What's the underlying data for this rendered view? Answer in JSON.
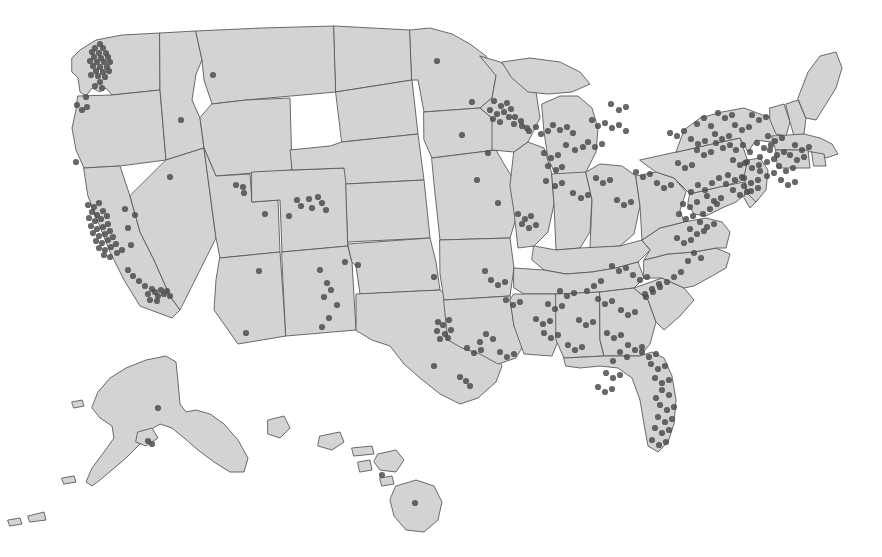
{
  "figure": {
    "width": 882,
    "height": 557,
    "background_color": "#ffffff"
  },
  "style": {
    "land_fill": "#d3d3d3",
    "land_stroke": "#5a5a5a",
    "land_stroke_width": 0.9,
    "point_color": "#4d4d4d",
    "point_opacity": 0.85,
    "point_radius": 3.1
  },
  "chart_data": {
    "type": "scatter",
    "xlabel": "",
    "ylabel": "",
    "projection": "albers-usa",
    "grid": false,
    "legend": null,
    "xlim": [
      0,
      882
    ],
    "ylim": [
      0,
      557
    ],
    "marker": {
      "shape": "circle",
      "radius": 3.1,
      "color": "#4d4d4d",
      "opacity": 0.85
    },
    "regions": [
      {
        "name": "Seattle-Puget Sound",
        "count": 26
      },
      {
        "name": "Portland-Oregon",
        "count": 4
      },
      {
        "name": "San Francisco Bay Area",
        "count": 30
      },
      {
        "name": "Los Angeles-San Diego",
        "count": 18
      },
      {
        "name": "Mountain West",
        "count": 14
      },
      {
        "name": "Colorado Front Range",
        "count": 9
      },
      {
        "name": "Southwest",
        "count": 12
      },
      {
        "name": "Texas Triangle",
        "count": 14
      },
      {
        "name": "Great Plains",
        "count": 10
      },
      {
        "name": "Upper Midwest",
        "count": 18
      },
      {
        "name": "Great Lakes",
        "count": 24
      },
      {
        "name": "Ohio Valley",
        "count": 14
      },
      {
        "name": "Southeast",
        "count": 20
      },
      {
        "name": "Florida",
        "count": 20
      },
      {
        "name": "Mid-Atlantic",
        "count": 16
      },
      {
        "name": "Northeast Corridor",
        "count": 58
      },
      {
        "name": "New England",
        "count": 16
      },
      {
        "name": "Alaska",
        "count": 3
      },
      {
        "name": "Hawaii",
        "count": 2
      }
    ],
    "total_points": 328,
    "points": [
      [
        100,
        44
      ],
      [
        95,
        48
      ],
      [
        103,
        48
      ],
      [
        92,
        52
      ],
      [
        99,
        53
      ],
      [
        106,
        53
      ],
      [
        94,
        57
      ],
      [
        101,
        58
      ],
      [
        108,
        57
      ],
      [
        90,
        61
      ],
      [
        97,
        62
      ],
      [
        104,
        62
      ],
      [
        110,
        62
      ],
      [
        93,
        66
      ],
      [
        100,
        67
      ],
      [
        107,
        67
      ],
      [
        96,
        71
      ],
      [
        103,
        72
      ],
      [
        109,
        71
      ],
      [
        91,
        75
      ],
      [
        98,
        76
      ],
      [
        105,
        77
      ],
      [
        100,
        82
      ],
      [
        95,
        86
      ],
      [
        102,
        88
      ],
      [
        86,
        97
      ],
      [
        77,
        105
      ],
      [
        87,
        107
      ],
      [
        82,
        110
      ],
      [
        76,
        162
      ],
      [
        88,
        205
      ],
      [
        94,
        207
      ],
      [
        99,
        203
      ],
      [
        92,
        212
      ],
      [
        97,
        215
      ],
      [
        103,
        211
      ],
      [
        89,
        218
      ],
      [
        95,
        221
      ],
      [
        101,
        219
      ],
      [
        107,
        216
      ],
      [
        91,
        226
      ],
      [
        97,
        229
      ],
      [
        103,
        227
      ],
      [
        108,
        224
      ],
      [
        93,
        233
      ],
      [
        99,
        236
      ],
      [
        105,
        234
      ],
      [
        110,
        231
      ],
      [
        96,
        241
      ],
      [
        102,
        243
      ],
      [
        108,
        240
      ],
      [
        113,
        237
      ],
      [
        99,
        248
      ],
      [
        105,
        250
      ],
      [
        111,
        247
      ],
      [
        116,
        244
      ],
      [
        104,
        255
      ],
      [
        110,
        257
      ],
      [
        117,
        253
      ],
      [
        122,
        250
      ],
      [
        125,
        209
      ],
      [
        128,
        228
      ],
      [
        131,
        245
      ],
      [
        128,
        270
      ],
      [
        133,
        276
      ],
      [
        139,
        281
      ],
      [
        145,
        286
      ],
      [
        152,
        289
      ],
      [
        148,
        294
      ],
      [
        155,
        292
      ],
      [
        161,
        290
      ],
      [
        158,
        296
      ],
      [
        164,
        294
      ],
      [
        167,
        291
      ],
      [
        170,
        296
      ],
      [
        150,
        300
      ],
      [
        157,
        301
      ],
      [
        213,
        75
      ],
      [
        181,
        120
      ],
      [
        135,
        215
      ],
      [
        170,
        177
      ],
      [
        236,
        185
      ],
      [
        243,
        187
      ],
      [
        244,
        193
      ],
      [
        297,
        200
      ],
      [
        301,
        206
      ],
      [
        309,
        199
      ],
      [
        318,
        197
      ],
      [
        322,
        203
      ],
      [
        312,
        208
      ],
      [
        326,
        210
      ],
      [
        289,
        216
      ],
      [
        265,
        214
      ],
      [
        259,
        271
      ],
      [
        246,
        333
      ],
      [
        320,
        270
      ],
      [
        327,
        283
      ],
      [
        331,
        290
      ],
      [
        324,
        297
      ],
      [
        337,
        305
      ],
      [
        329,
        318
      ],
      [
        322,
        327
      ],
      [
        345,
        262
      ],
      [
        358,
        265
      ],
      [
        434,
        277
      ],
      [
        438,
        322
      ],
      [
        443,
        325
      ],
      [
        449,
        320
      ],
      [
        437,
        331
      ],
      [
        445,
        334
      ],
      [
        440,
        339
      ],
      [
        451,
        330
      ],
      [
        448,
        338
      ],
      [
        434,
        366
      ],
      [
        460,
        377
      ],
      [
        466,
        381
      ],
      [
        470,
        386
      ],
      [
        437,
        61
      ],
      [
        472,
        102
      ],
      [
        462,
        135
      ],
      [
        477,
        180
      ],
      [
        488,
        153
      ],
      [
        498,
        203
      ],
      [
        485,
        271
      ],
      [
        494,
        101
      ],
      [
        501,
        106
      ],
      [
        507,
        103
      ],
      [
        490,
        110
      ],
      [
        497,
        114
      ],
      [
        504,
        112
      ],
      [
        511,
        109
      ],
      [
        493,
        119
      ],
      [
        500,
        122
      ],
      [
        509,
        117
      ],
      [
        514,
        124
      ],
      [
        521,
        121
      ],
      [
        527,
        128
      ],
      [
        515,
        117
      ],
      [
        522,
        126
      ],
      [
        529,
        131
      ],
      [
        536,
        127
      ],
      [
        541,
        134
      ],
      [
        548,
        131
      ],
      [
        553,
        125
      ],
      [
        560,
        130
      ],
      [
        567,
        127
      ],
      [
        573,
        133
      ],
      [
        544,
        153
      ],
      [
        551,
        158
      ],
      [
        558,
        155
      ],
      [
        548,
        166
      ],
      [
        556,
        170
      ],
      [
        562,
        167
      ],
      [
        566,
        145
      ],
      [
        575,
        150
      ],
      [
        583,
        147
      ],
      [
        592,
        120
      ],
      [
        598,
        126
      ],
      [
        605,
        123
      ],
      [
        612,
        128
      ],
      [
        619,
        125
      ],
      [
        626,
        131
      ],
      [
        588,
        142
      ],
      [
        595,
        147
      ],
      [
        602,
        144
      ],
      [
        611,
        104
      ],
      [
        619,
        110
      ],
      [
        626,
        107
      ],
      [
        518,
        214
      ],
      [
        525,
        219
      ],
      [
        531,
        216
      ],
      [
        522,
        224
      ],
      [
        529,
        228
      ],
      [
        536,
        225
      ],
      [
        546,
        181
      ],
      [
        555,
        186
      ],
      [
        562,
        183
      ],
      [
        573,
        193
      ],
      [
        581,
        198
      ],
      [
        588,
        195
      ],
      [
        596,
        178
      ],
      [
        603,
        183
      ],
      [
        610,
        180
      ],
      [
        617,
        200
      ],
      [
        624,
        205
      ],
      [
        631,
        202
      ],
      [
        636,
        172
      ],
      [
        643,
        177
      ],
      [
        650,
        174
      ],
      [
        657,
        183
      ],
      [
        664,
        188
      ],
      [
        671,
        185
      ],
      [
        678,
        163
      ],
      [
        685,
        168
      ],
      [
        692,
        165
      ],
      [
        697,
        150
      ],
      [
        704,
        155
      ],
      [
        711,
        152
      ],
      [
        715,
        134
      ],
      [
        722,
        139
      ],
      [
        729,
        136
      ],
      [
        735,
        125
      ],
      [
        742,
        130
      ],
      [
        749,
        127
      ],
      [
        752,
        115
      ],
      [
        759,
        120
      ],
      [
        766,
        117
      ],
      [
        768,
        136
      ],
      [
        775,
        141
      ],
      [
        782,
        138
      ],
      [
        770,
        150
      ],
      [
        777,
        155
      ],
      [
        784,
        152
      ],
      [
        760,
        157
      ],
      [
        767,
        162
      ],
      [
        774,
        159
      ],
      [
        745,
        163
      ],
      [
        752,
        168
      ],
      [
        759,
        165
      ],
      [
        733,
        160
      ],
      [
        740,
        165
      ],
      [
        747,
        162
      ],
      [
        728,
        175
      ],
      [
        735,
        180
      ],
      [
        742,
        177
      ],
      [
        744,
        178
      ],
      [
        751,
        183
      ],
      [
        758,
        180
      ],
      [
        760,
        171
      ],
      [
        767,
        176
      ],
      [
        774,
        173
      ],
      [
        779,
        166
      ],
      [
        786,
        171
      ],
      [
        793,
        168
      ],
      [
        744,
        186
      ],
      [
        751,
        191
      ],
      [
        758,
        188
      ],
      [
        733,
        190
      ],
      [
        740,
        195
      ],
      [
        747,
        192
      ],
      [
        726,
        184
      ],
      [
        719,
        178
      ],
      [
        712,
        183
      ],
      [
        705,
        190
      ],
      [
        698,
        185
      ],
      [
        691,
        192
      ],
      [
        736,
        150
      ],
      [
        743,
        145
      ],
      [
        750,
        152
      ],
      [
        757,
        143
      ],
      [
        764,
        148
      ],
      [
        771,
        145
      ],
      [
        790,
        155
      ],
      [
        797,
        160
      ],
      [
        804,
        157
      ],
      [
        795,
        145
      ],
      [
        802,
        150
      ],
      [
        809,
        147
      ],
      [
        781,
        180
      ],
      [
        788,
        185
      ],
      [
        795,
        182
      ],
      [
        707,
        196
      ],
      [
        714,
        201
      ],
      [
        721,
        198
      ],
      [
        697,
        202
      ],
      [
        690,
        207
      ],
      [
        683,
        204
      ],
      [
        679,
        214
      ],
      [
        686,
        219
      ],
      [
        693,
        216
      ],
      [
        700,
        222
      ],
      [
        707,
        227
      ],
      [
        714,
        224
      ],
      [
        690,
        229
      ],
      [
        697,
        234
      ],
      [
        704,
        231
      ],
      [
        677,
        238
      ],
      [
        684,
        243
      ],
      [
        691,
        240
      ],
      [
        697,
        124
      ],
      [
        704,
        118
      ],
      [
        711,
        126
      ],
      [
        718,
        113
      ],
      [
        725,
        118
      ],
      [
        732,
        115
      ],
      [
        716,
        143
      ],
      [
        723,
        148
      ],
      [
        730,
        145
      ],
      [
        691,
        139
      ],
      [
        698,
        144
      ],
      [
        705,
        141
      ],
      [
        684,
        131
      ],
      [
        677,
        136
      ],
      [
        670,
        133
      ],
      [
        717,
        204
      ],
      [
        710,
        209
      ],
      [
        703,
        214
      ],
      [
        694,
        253
      ],
      [
        701,
        258
      ],
      [
        688,
        261
      ],
      [
        681,
        272
      ],
      [
        674,
        277
      ],
      [
        667,
        282
      ],
      [
        660,
        287
      ],
      [
        653,
        292
      ],
      [
        646,
        297
      ],
      [
        645,
        294
      ],
      [
        652,
        289
      ],
      [
        659,
        284
      ],
      [
        612,
        266
      ],
      [
        619,
        271
      ],
      [
        626,
        268
      ],
      [
        633,
        275
      ],
      [
        640,
        280
      ],
      [
        647,
        277
      ],
      [
        601,
        281
      ],
      [
        594,
        286
      ],
      [
        587,
        291
      ],
      [
        598,
        299
      ],
      [
        605,
        304
      ],
      [
        612,
        301
      ],
      [
        621,
        310
      ],
      [
        628,
        315
      ],
      [
        635,
        312
      ],
      [
        560,
        291
      ],
      [
        567,
        296
      ],
      [
        574,
        293
      ],
      [
        548,
        304
      ],
      [
        555,
        309
      ],
      [
        562,
        306
      ],
      [
        536,
        319
      ],
      [
        543,
        324
      ],
      [
        550,
        321
      ],
      [
        579,
        320
      ],
      [
        586,
        325
      ],
      [
        593,
        322
      ],
      [
        607,
        333
      ],
      [
        614,
        338
      ],
      [
        621,
        335
      ],
      [
        628,
        345
      ],
      [
        635,
        350
      ],
      [
        642,
        347
      ],
      [
        642,
        352
      ],
      [
        649,
        357
      ],
      [
        656,
        354
      ],
      [
        651,
        364
      ],
      [
        658,
        369
      ],
      [
        665,
        366
      ],
      [
        655,
        378
      ],
      [
        662,
        383
      ],
      [
        669,
        380
      ],
      [
        662,
        390
      ],
      [
        669,
        395
      ],
      [
        656,
        398
      ],
      [
        660,
        405
      ],
      [
        667,
        410
      ],
      [
        674,
        407
      ],
      [
        658,
        417
      ],
      [
        665,
        422
      ],
      [
        672,
        419
      ],
      [
        655,
        428
      ],
      [
        662,
        433
      ],
      [
        669,
        430
      ],
      [
        652,
        440
      ],
      [
        659,
        445
      ],
      [
        666,
        442
      ],
      [
        620,
        352
      ],
      [
        627,
        357
      ],
      [
        613,
        361
      ],
      [
        606,
        373
      ],
      [
        613,
        378
      ],
      [
        620,
        375
      ],
      [
        598,
        387
      ],
      [
        605,
        392
      ],
      [
        612,
        389
      ],
      [
        500,
        352
      ],
      [
        507,
        357
      ],
      [
        514,
        354
      ],
      [
        486,
        334
      ],
      [
        493,
        339
      ],
      [
        480,
        342
      ],
      [
        467,
        348
      ],
      [
        474,
        353
      ],
      [
        481,
        350
      ],
      [
        506,
        300
      ],
      [
        513,
        305
      ],
      [
        520,
        302
      ],
      [
        491,
        280
      ],
      [
        498,
        285
      ],
      [
        505,
        282
      ],
      [
        544,
        333
      ],
      [
        551,
        338
      ],
      [
        558,
        335
      ],
      [
        568,
        345
      ],
      [
        575,
        350
      ],
      [
        582,
        347
      ],
      [
        158,
        408
      ],
      [
        148,
        441
      ],
      [
        152,
        444
      ],
      [
        382,
        475
      ],
      [
        415,
        503
      ]
    ]
  },
  "states": {
    "count": 50,
    "insets": [
      "Alaska",
      "Hawaii"
    ]
  },
  "accessibility": {
    "alt_text": "Choropleth-style gray map of the United States with dark gray dots marking locations, densest along the Northeast corridor, California coast, Puget Sound and south Florida."
  }
}
